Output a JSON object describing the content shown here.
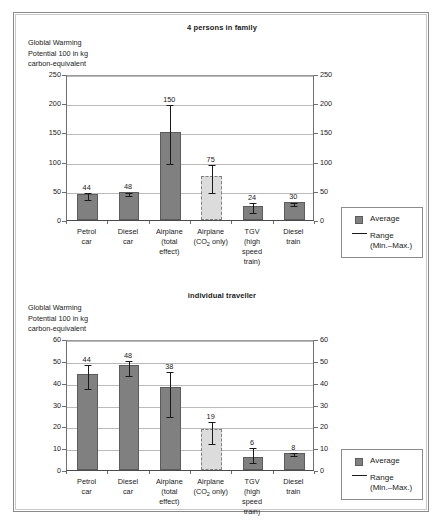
{
  "figure": {
    "axis_caption": "Globlal Warming\nPotential 100 in kg\ncarbon-equivalent",
    "legend": {
      "average_label": "Average",
      "range_label": "Range\n(Min.–Max.)",
      "average_color": "#808080",
      "range_color": "#1a1a1a"
    },
    "categories": [
      "Petrol\ncar",
      "Diesel\ncar",
      "Airplane\n(total\neffect)",
      "Airplane\n(CO₂ only)",
      "TGV\n(high\nspeed\ntrain)",
      "Diesel\ntrain"
    ]
  },
  "chart_data": [
    {
      "type": "bar",
      "title": "4 persons in family",
      "xlabel": "",
      "ylabel": "Globlal Warming Potential 100 in kg carbon-equivalent",
      "ylim": [
        0,
        250
      ],
      "yticks": [
        0,
        50,
        100,
        150,
        200,
        250
      ],
      "grid": true,
      "legend_position": "right",
      "categories": [
        "Petrol car",
        "Diesel car",
        "Airplane (total effect)",
        "Airplane (CO2 only)",
        "TGV (high speed train)",
        "Diesel train"
      ],
      "series": [
        {
          "name": "Average",
          "values": [
            44,
            48,
            150,
            75,
            24,
            30
          ],
          "labels": [
            "44",
            "48",
            "150",
            "75",
            "24",
            "30"
          ]
        },
        {
          "name": "Range (Min.-Max.)",
          "min": [
            38,
            44,
            100,
            50,
            16,
            28
          ],
          "max": [
            49,
            50,
            200,
            97,
            33,
            32
          ]
        }
      ],
      "bar_styles": [
        "solid",
        "solid",
        "solid",
        "dashed",
        "solid",
        "solid"
      ]
    },
    {
      "type": "bar",
      "title": "individual traveller",
      "xlabel": "",
      "ylabel": "Globlal Warming Potential 100 in kg carbon-equivalent",
      "ylim": [
        0,
        60
      ],
      "yticks": [
        0,
        10,
        20,
        30,
        40,
        50,
        60
      ],
      "grid": true,
      "legend_position": "right",
      "categories": [
        "Petrol car",
        "Diesel car",
        "Airplane (total effect)",
        "Airplane (CO2 only)",
        "TGV (high speed train)",
        "Diesel train"
      ],
      "series": [
        {
          "name": "Average",
          "values": [
            44,
            48,
            38,
            19,
            6,
            8
          ],
          "labels": [
            "44",
            "48",
            "38",
            "19",
            "6",
            "8"
          ]
        },
        {
          "name": "Range (Min.-Max.)",
          "min": [
            38,
            44,
            25,
            13,
            4,
            7.5
          ],
          "max": [
            49,
            51,
            46,
            23,
            11,
            8.5
          ]
        }
      ],
      "bar_styles": [
        "solid",
        "solid",
        "solid",
        "dashed",
        "solid",
        "solid"
      ]
    }
  ]
}
